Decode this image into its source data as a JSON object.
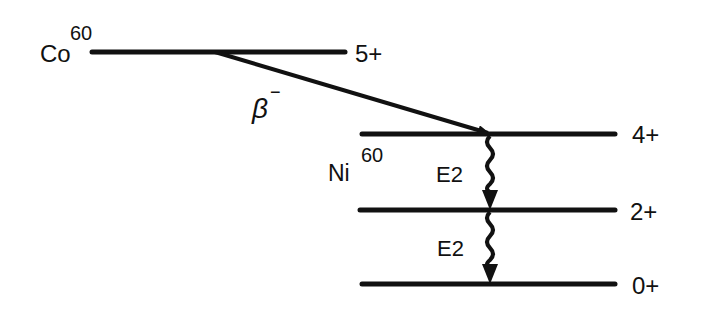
{
  "diagram": {
    "parent": {
      "element": "Co",
      "mass": "60",
      "level_spin": "5+"
    },
    "decay": {
      "label": "β",
      "superscript": "−"
    },
    "daughter": {
      "element": "Ni",
      "mass": "60",
      "levels": [
        {
          "spin": "4+"
        },
        {
          "spin": "2+"
        },
        {
          "spin": "0+"
        }
      ],
      "transitions": [
        {
          "from": "4+",
          "to": "2+",
          "label": "E2"
        },
        {
          "from": "2+",
          "to": "0+",
          "label": "E2"
        }
      ]
    }
  }
}
